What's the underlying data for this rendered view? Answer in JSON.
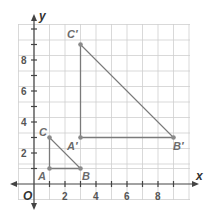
{
  "diagram": {
    "type": "coordinate-grid",
    "axes": {
      "x_label": "x",
      "y_label": "y",
      "origin_label": "O"
    },
    "x_ticks": [
      "2",
      "4",
      "6",
      "8"
    ],
    "y_ticks": [
      "2",
      "4",
      "6",
      "8"
    ],
    "triangles": [
      {
        "name": "ABC",
        "vertices": [
          {
            "label": "A",
            "x": 1,
            "y": 1
          },
          {
            "label": "B",
            "x": 3,
            "y": 1
          },
          {
            "label": "C",
            "x": 1,
            "y": 3
          }
        ]
      },
      {
        "name": "A'B'C'",
        "vertices": [
          {
            "label": "A′",
            "x": 3,
            "y": 3
          },
          {
            "label": "B′",
            "x": 9,
            "y": 3
          },
          {
            "label": "C′",
            "x": 3,
            "y": 9
          }
        ]
      }
    ],
    "colors": {
      "grid": "#c8c8c8",
      "axis": "#444444",
      "shape": "#7a7a7a",
      "point": "#8a8a8a"
    }
  }
}
